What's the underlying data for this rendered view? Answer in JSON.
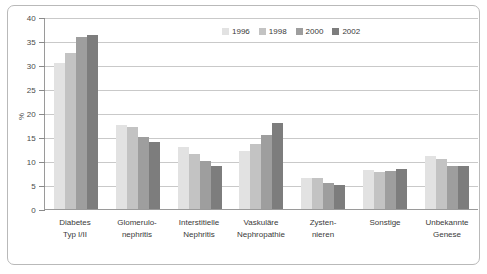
{
  "chart_data": {
    "type": "bar",
    "title": "",
    "xlabel": "",
    "ylabel": "%",
    "ylim": [
      0,
      40
    ],
    "yticks": [
      0,
      5,
      10,
      15,
      20,
      25,
      30,
      35,
      40
    ],
    "grid": true,
    "legend_position": "top",
    "categories": [
      "Diabetes Typ I/II",
      "Glomerulonephritis",
      "Interstitielle Nephritis",
      "Vaskuläre Nephropathie",
      "Zystennieren",
      "Sonstige",
      "Unbekannte Genese"
    ],
    "category_lines": [
      [
        "Diabetes",
        "Typ I/II"
      ],
      [
        "Glomerulo-",
        "nephritis"
      ],
      [
        "Interstitielle",
        "Nephritis"
      ],
      [
        "Vaskuläre",
        "Nephropathie"
      ],
      [
        "Zysten-",
        "nieren"
      ],
      [
        "Sonstige",
        ""
      ],
      [
        "Unbekannte",
        "Genese"
      ]
    ],
    "series": [
      {
        "name": "1996",
        "color": "#e2e2e2",
        "values": [
          30.5,
          17.5,
          13.0,
          12.0,
          6.5,
          8.2,
          11.0
        ]
      },
      {
        "name": "1998",
        "color": "#c3c3c3",
        "values": [
          32.5,
          17.0,
          11.5,
          13.5,
          6.5,
          7.8,
          10.5
        ]
      },
      {
        "name": "2000",
        "color": "#9e9e9e",
        "values": [
          35.8,
          15.0,
          10.0,
          15.5,
          5.5,
          8.0,
          9.0
        ]
      },
      {
        "name": "2002",
        "color": "#7d7d7d",
        "values": [
          36.2,
          14.0,
          9.0,
          18.0,
          5.0,
          8.4,
          9.0
        ]
      }
    ]
  },
  "legend": {
    "items": [
      {
        "label": "1996"
      },
      {
        "label": "1998"
      },
      {
        "label": "2000"
      },
      {
        "label": "2002"
      }
    ]
  },
  "colors": {
    "grid": "#c9c9c9",
    "axis": "#9a9a9a",
    "frame": "#b9b9b9",
    "text": "#3a3a3a",
    "background": "#ffffff"
  }
}
